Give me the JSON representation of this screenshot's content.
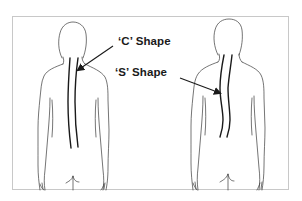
{
  "diagram": {
    "type": "illustration",
    "figures": [
      {
        "id": "left-figure",
        "view": "back",
        "spine_shape": "C"
      },
      {
        "id": "right-figure",
        "view": "back",
        "spine_shape": "S"
      }
    ],
    "labels": {
      "c_shape": "‘C’ Shape",
      "s_shape": "‘S’ Shape"
    },
    "arrows": [
      {
        "from_label": "c_shape",
        "points_to": "left-figure spine (upper thoracic)"
      },
      {
        "from_label": "s_shape",
        "points_to": "right-figure spine (mid thoracic)"
      }
    ],
    "colors": {
      "outline": "#3a3a3a",
      "spine": "#1a1a1a",
      "frame_border": "#c8c8c8",
      "background": "#ffffff"
    }
  }
}
